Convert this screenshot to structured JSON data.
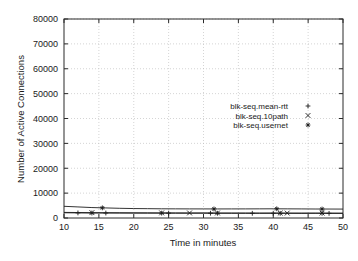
{
  "chart_data": {
    "type": "line",
    "title": "",
    "xlabel": "Time in minutes",
    "ylabel": "Number of Active Connections",
    "xlim": [
      10,
      50
    ],
    "ylim": [
      0,
      80000
    ],
    "xticks": [
      10,
      15,
      20,
      25,
      30,
      35,
      40,
      45,
      50
    ],
    "yticks": [
      0,
      10000,
      20000,
      30000,
      40000,
      50000,
      60000,
      70000,
      80000
    ],
    "xtick_labels": [
      "10",
      "15",
      "20",
      "25",
      "30",
      "35",
      "40",
      "45",
      "50"
    ],
    "ytick_labels": [
      "0",
      "10000",
      "20000",
      "30000",
      "40000",
      "50000",
      "60000",
      "70000",
      "80000"
    ],
    "grid": true,
    "grid_style": "dotted",
    "legend_position": "inside-upper-right",
    "series": [
      {
        "name": "blk-seq.mean-rtt",
        "marker": "plus",
        "x": [
          10,
          12,
          14,
          16,
          18,
          20,
          22,
          24,
          26,
          28,
          30,
          32,
          34,
          36,
          38,
          40,
          42,
          44,
          46,
          48,
          50
        ],
        "values": [
          2100,
          2050,
          2000,
          2000,
          1980,
          1960,
          1950,
          1950,
          1930,
          1920,
          1930,
          1900,
          1900,
          1890,
          1880,
          1900,
          1880,
          1870,
          1880,
          1860,
          1850
        ],
        "marker_x": [
          12,
          14,
          16,
          24,
          25,
          31,
          32,
          37,
          40,
          41,
          47,
          48
        ],
        "marker_values": [
          2050,
          2000,
          2000,
          1950,
          1950,
          1920,
          1900,
          1890,
          1900,
          1880,
          1870,
          1860
        ]
      },
      {
        "name": "blk-seq.10path",
        "marker": "cross",
        "x": [
          10,
          12,
          14,
          16,
          18,
          20,
          22,
          24,
          26,
          28,
          30,
          32,
          34,
          36,
          38,
          40,
          42,
          44,
          46,
          48,
          50
        ],
        "values": [
          2250,
          2200,
          2150,
          2120,
          2100,
          2080,
          2070,
          2050,
          2040,
          2030,
          2030,
          2010,
          2000,
          2000,
          1990,
          1990,
          1980,
          1970,
          1980,
          1960,
          1950
        ],
        "marker_x": [
          14,
          24,
          28,
          32,
          41,
          42,
          47
        ],
        "marker_values": [
          2150,
          2050,
          2030,
          2010,
          1985,
          1980,
          1970
        ]
      },
      {
        "name": "blk-seq.usernet",
        "marker": "star",
        "x": [
          10,
          12,
          14,
          16,
          18,
          20,
          22,
          24,
          26,
          28,
          30,
          32,
          34,
          36,
          38,
          40,
          42,
          44,
          46,
          48,
          50
        ],
        "values": [
          4700,
          4450,
          4200,
          4050,
          3900,
          3800,
          3750,
          3700,
          3680,
          3660,
          3650,
          3640,
          3650,
          3660,
          3680,
          3700,
          3680,
          3650,
          3620,
          3600,
          3580
        ],
        "marker_x": [
          15.5,
          31.5,
          40.5,
          47
        ],
        "marker_values": [
          4080,
          3640,
          3700,
          3610
        ]
      }
    ]
  },
  "legend": {
    "entries": [
      {
        "label": "blk-seq.mean-rtt",
        "symbol": "+"
      },
      {
        "label": "blk-seq.10path",
        "symbol": "×"
      },
      {
        "label": "blk-seq.usernet",
        "symbol": "✳"
      }
    ]
  }
}
